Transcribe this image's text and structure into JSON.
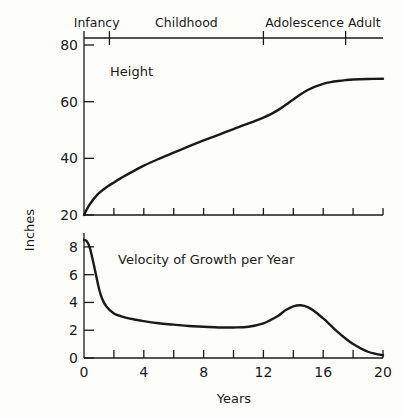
{
  "figure": {
    "background_color": "#fdfdfa",
    "ink_color": "#1a1a1a"
  },
  "top_axis": {
    "name": "life-stage-axis",
    "stages": [
      {
        "label": "Infancy",
        "start_year": 0,
        "end_year": 1.7
      },
      {
        "label": "Childhood",
        "start_year": 1.7,
        "end_year": 12
      },
      {
        "label": "Adolescence",
        "start_year": 12,
        "end_year": 17.5
      },
      {
        "label": "Adult",
        "start_year": 17.5,
        "end_year": 20
      }
    ],
    "tick_years": [
      0,
      1.7,
      12,
      17.5
    ]
  },
  "axis_titles": {
    "y": "Inches",
    "x": "Years"
  },
  "chart_data": [
    {
      "type": "line",
      "name": "height-chart",
      "title": "Height",
      "xlabel": "Years",
      "ylabel": "Inches",
      "xlim": [
        0,
        20
      ],
      "ylim": [
        20,
        80
      ],
      "xticks": [
        0,
        2,
        4,
        6,
        8,
        10,
        12,
        14,
        16,
        18,
        20
      ],
      "xtick_labels": [
        "0",
        "",
        "4",
        "",
        "8",
        "",
        "12",
        "",
        "16",
        "",
        "20"
      ],
      "yticks": [
        20,
        40,
        60,
        80
      ],
      "ytick_labels": [
        "20",
        "40",
        "60",
        "80"
      ],
      "grid": false,
      "legend": "none",
      "x": [
        0,
        0.25,
        0.5,
        0.75,
        1,
        1.5,
        2,
        2.5,
        3,
        4,
        5,
        6,
        7,
        8,
        9,
        10,
        11,
        12,
        12.5,
        13,
        13.5,
        14,
        14.5,
        15,
        15.5,
        16,
        16.5,
        17,
        17.5,
        18,
        19,
        20
      ],
      "y": [
        20,
        22.6,
        24.6,
        26.3,
        27.7,
        29.8,
        31.5,
        33.1,
        34.6,
        37.4,
        39.8,
        42.0,
        44.2,
        46.3,
        48.3,
        50.3,
        52.3,
        54.4,
        55.6,
        57.1,
        58.9,
        60.8,
        62.6,
        64.2,
        65.4,
        66.3,
        66.9,
        67.3,
        67.6,
        67.8,
        68.0,
        68.1
      ]
    },
    {
      "type": "line",
      "name": "velocity-chart",
      "title": "Velocity of Growth per Year",
      "xlabel": "Years",
      "ylabel": "Inches",
      "xlim": [
        0,
        20
      ],
      "ylim": [
        0,
        9
      ],
      "xticks": [
        0,
        2,
        4,
        6,
        8,
        10,
        12,
        14,
        16,
        18,
        20
      ],
      "xtick_labels": [
        "0",
        "",
        "4",
        "",
        "8",
        "",
        "12",
        "",
        "16",
        "",
        "20"
      ],
      "yticks": [
        0,
        2,
        4,
        6,
        8
      ],
      "ytick_labels": [
        "0",
        "2",
        "4",
        "6",
        "8"
      ],
      "grid": false,
      "legend": "none",
      "x": [
        0,
        0.2,
        0.4,
        0.6,
        0.8,
        1,
        1.2,
        1.5,
        2,
        2.5,
        3,
        4,
        5,
        6,
        7,
        8,
        9,
        10,
        11,
        12,
        12.5,
        13,
        13.5,
        14,
        14.5,
        15,
        15.5,
        16,
        16.5,
        17,
        17.5,
        18,
        18.5,
        19,
        19.5,
        20
      ],
      "y": [
        8.5,
        8.4,
        7.9,
        7.0,
        6.0,
        5.0,
        4.3,
        3.7,
        3.2,
        3.0,
        2.85,
        2.65,
        2.5,
        2.4,
        2.3,
        2.25,
        2.2,
        2.2,
        2.25,
        2.5,
        2.75,
        3.05,
        3.45,
        3.72,
        3.8,
        3.65,
        3.3,
        2.85,
        2.35,
        1.85,
        1.4,
        1.0,
        0.7,
        0.45,
        0.3,
        0.2
      ]
    }
  ]
}
